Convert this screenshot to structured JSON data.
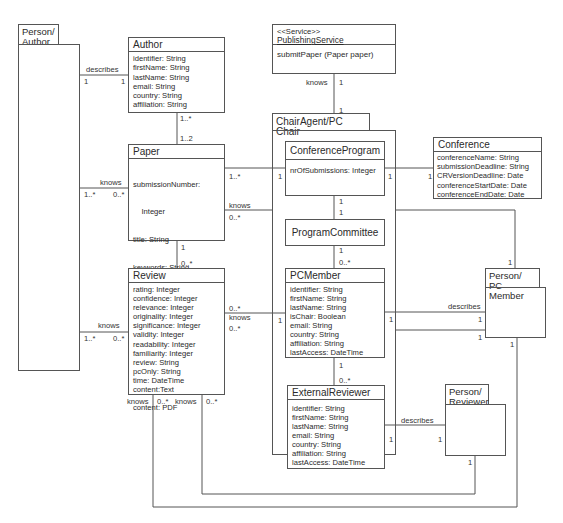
{
  "diagram": {
    "type": "UML class diagram",
    "classes": {
      "person_author": {
        "name": "Person/\nAuthor",
        "line1": "Person/",
        "line2": "Author"
      },
      "author": {
        "name": "Author",
        "attributes": [
          "identifier: String",
          "firstName: String",
          "lastName: String",
          "email: String",
          "country: String",
          "affiliation: String"
        ]
      },
      "publishing_service": {
        "stereotype": "<<Service>>",
        "name": "PublishingService",
        "operations": [
          "submitPaper (Paper paper)"
        ]
      },
      "chair_agent": {
        "name": "ChairAgent/PC Chair"
      },
      "conference_program": {
        "name": "ConferenceProgram",
        "attributes": [
          "nrOfSubmissions: Integer"
        ]
      },
      "conference": {
        "name": "Conference",
        "attributes": [
          "conferenceName: String",
          "submissionDeadline: String",
          "CRVersionDeadline: Date",
          "conferenceStartDate: Date",
          "conferenceEndDate: Date"
        ]
      },
      "paper": {
        "name": "Paper",
        "attributes": [
          "submissionNumber:",
          "    Integer",
          "title: String",
          "keywords: String",
          "abstract: String",
          "time: DateTime",
          "fax: String",
          "address: String",
          "content: PDF"
        ]
      },
      "program_committee": {
        "name": "ProgramCommittee"
      },
      "review": {
        "name": "Review",
        "attributes": [
          "rating: Integer",
          "confidence: Integer",
          "relevance: Integer",
          "originality: Integer",
          "significance: Integer",
          "validity: Integer",
          "readability: Integer",
          "familiarity: Integer",
          "review: String",
          "pcOnly: String",
          "time: DateTime",
          "content:Text"
        ]
      },
      "pc_member": {
        "name": "PCMember",
        "attributes": [
          "identifier: String",
          "firstName: String",
          "lastName: String",
          "isChair: Boolean",
          "email: String",
          "country: String",
          "affiliation: String",
          "lastAccess: DateTime"
        ]
      },
      "person_pc_member": {
        "line1": "Person/",
        "line2": "PC Member"
      },
      "external_reviewer": {
        "name": "ExternalReviewer",
        "attributes": [
          "identifier: String",
          "firstName: String",
          "lastName: String",
          "email: String",
          "country: String",
          "affiliation: String",
          "lastAccess: DateTime"
        ]
      },
      "person_reviewer": {
        "line1": "Person/",
        "line2": "Reviewer"
      }
    },
    "associations": {
      "person_author_author": {
        "label": "describes",
        "m1": "1",
        "m2": "1"
      },
      "author_paper": {
        "m1": "1..*",
        "m2": "1..2"
      },
      "person_author_paper": {
        "label": "knows",
        "m1": "1..*",
        "m2": "0..*"
      },
      "paper_review": {
        "m1": "1",
        "m2": "0..*"
      },
      "person_author_review": {
        "label": "knows",
        "m1": "1..*",
        "m2": "0..*"
      },
      "publishing_chair": {
        "label": "knows",
        "m1": "1",
        "m2": "1"
      },
      "paper_confprog": {
        "m1": "1..*",
        "m2": "1"
      },
      "paper_chair": {
        "label": "knows",
        "m1": "0..*"
      },
      "confprog_conference": {
        "m1": "1",
        "m2": "1"
      },
      "confprog_committee": {
        "m1": "1",
        "m2": "1"
      },
      "committee_pcmember": {
        "m1": "1",
        "m2": "0..*"
      },
      "review_pcmember": {
        "label": "knows",
        "m1": "0..*",
        "m2": "0..*",
        "m3": "1"
      },
      "pcmember_person": {
        "label": "describes",
        "m1": "1",
        "m2": "1"
      },
      "chair_person_pc": {
        "m1": "1",
        "m2": "1"
      },
      "pcmember_external": {
        "m1": "1",
        "m2": "0..*"
      },
      "external_person_reviewer": {
        "label": "describes",
        "m1": "1",
        "m2": "1"
      },
      "review_person_reviewer": {
        "label": "knows",
        "m1": "0..*",
        "m2": "1"
      },
      "review_person_pc": {
        "label": "knows",
        "m1": "0..*",
        "m2": "1"
      }
    }
  }
}
